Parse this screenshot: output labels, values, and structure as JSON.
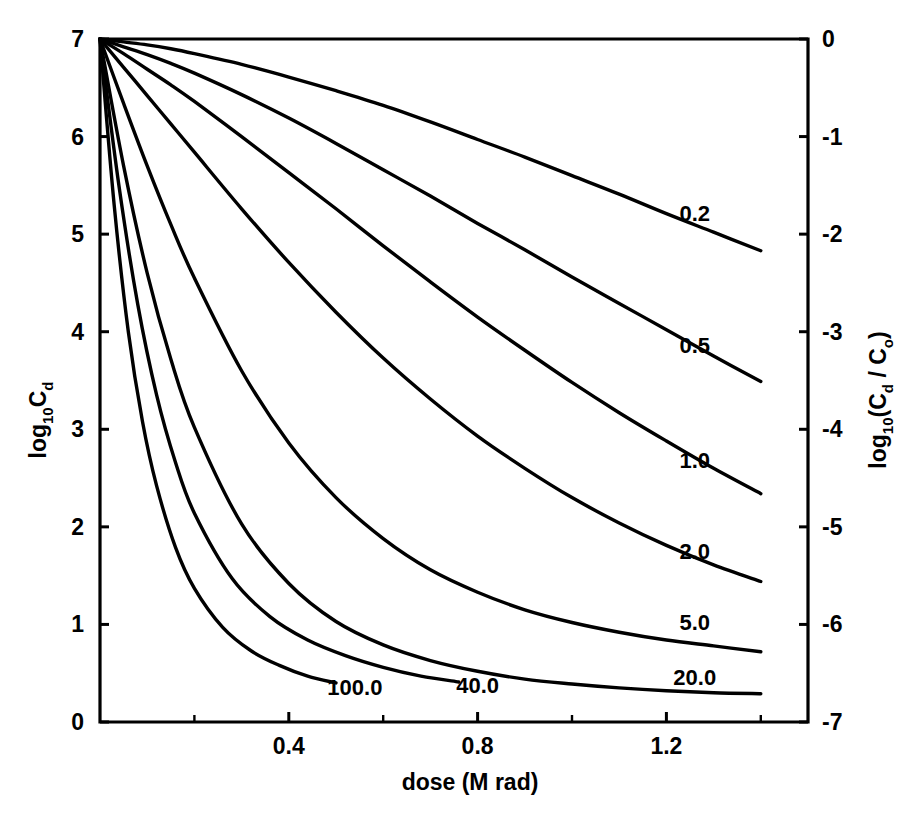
{
  "chart_data": {
    "type": "line",
    "title": "",
    "xlabel": "dose (M rad)",
    "ylabel": "log",
    "ylabel_sub": "10",
    "ylabel_tail": "C",
    "ylabel_tail_sub": "d",
    "ylabel_right_prefix": "log",
    "ylabel_right_sub": "10",
    "ylabel_right_tail": "(C",
    "ylabel_right_tail_sub": "d",
    "ylabel_right_tail2": " / C",
    "ylabel_right_tail2_sub": "o",
    "ylabel_right_tail3": ")",
    "xlim": [
      0.0,
      1.5
    ],
    "ylim": [
      0,
      7
    ],
    "y2lim": [
      -7,
      0
    ],
    "grid": false,
    "legend_position": "inline-right-of-curve-ends",
    "x_tick_labels": [
      "0.4",
      "0.8",
      "1.2"
    ],
    "x_tick_values": [
      0.4,
      0.8,
      1.2
    ],
    "x_minor_tick_values": [
      0.2,
      0.6,
      1.0,
      1.4
    ],
    "y_tick_labels": [
      "0",
      "1",
      "2",
      "3",
      "4",
      "5",
      "6",
      "7"
    ],
    "y_tick_values": [
      0,
      1,
      2,
      3,
      4,
      5,
      6,
      7
    ],
    "y2_tick_labels": [
      "0",
      "-1",
      "-2",
      "-3",
      "-4",
      "-5",
      "-6",
      "-7"
    ],
    "y2_tick_values": [
      0,
      -1,
      -2,
      -3,
      -4,
      -5,
      -6,
      -7
    ],
    "series": [
      {
        "name": "0.2",
        "label": "0.2",
        "x": [
          0.0,
          0.05,
          0.1,
          0.15,
          0.2,
          0.3,
          0.4,
          0.5,
          0.6,
          0.7,
          0.8,
          0.9,
          1.0,
          1.1,
          1.2,
          1.3,
          1.4
        ],
        "values": [
          7.0,
          6.97,
          6.94,
          6.9,
          6.85,
          6.74,
          6.61,
          6.47,
          6.32,
          6.15,
          5.97,
          5.79,
          5.6,
          5.41,
          5.21,
          5.02,
          4.83
        ]
      },
      {
        "name": "0.5",
        "label": "0.5",
        "x": [
          0.0,
          0.05,
          0.1,
          0.15,
          0.2,
          0.3,
          0.4,
          0.5,
          0.6,
          0.7,
          0.8,
          0.9,
          1.0,
          1.1,
          1.2,
          1.3,
          1.4
        ],
        "values": [
          7.0,
          6.92,
          6.84,
          6.75,
          6.65,
          6.43,
          6.19,
          5.93,
          5.66,
          5.39,
          5.11,
          4.84,
          4.56,
          4.29,
          4.02,
          3.75,
          3.49
        ]
      },
      {
        "name": "1.0",
        "label": "1.0",
        "x": [
          0.0,
          0.05,
          0.1,
          0.15,
          0.2,
          0.3,
          0.4,
          0.5,
          0.6,
          0.7,
          0.8,
          0.9,
          1.0,
          1.1,
          1.2,
          1.3,
          1.4
        ],
        "values": [
          7.0,
          6.85,
          6.69,
          6.53,
          6.36,
          6.0,
          5.63,
          5.26,
          4.88,
          4.51,
          4.15,
          3.81,
          3.48,
          3.17,
          2.88,
          2.6,
          2.34
        ]
      },
      {
        "name": "2.0",
        "label": "2.0",
        "x": [
          0.0,
          0.05,
          0.1,
          0.15,
          0.2,
          0.3,
          0.4,
          0.5,
          0.6,
          0.7,
          0.8,
          0.9,
          1.0,
          1.1,
          1.2,
          1.3,
          1.4
        ],
        "values": [
          7.0,
          6.71,
          6.42,
          6.13,
          5.84,
          5.26,
          4.71,
          4.2,
          3.73,
          3.31,
          2.93,
          2.6,
          2.3,
          2.04,
          1.81,
          1.61,
          1.44
        ]
      },
      {
        "name": "5.0",
        "label": "5.0",
        "x": [
          0.0,
          0.05,
          0.1,
          0.15,
          0.2,
          0.3,
          0.4,
          0.5,
          0.6,
          0.7,
          0.8,
          0.9,
          1.0,
          1.1,
          1.2,
          1.3,
          1.4
        ],
        "values": [
          7.0,
          6.34,
          5.7,
          5.1,
          4.55,
          3.6,
          2.86,
          2.3,
          1.88,
          1.56,
          1.33,
          1.15,
          1.02,
          0.92,
          0.84,
          0.78,
          0.72
        ]
      },
      {
        "name": "20.0",
        "label": "20.0",
        "x": [
          0.0,
          0.05,
          0.1,
          0.15,
          0.2,
          0.3,
          0.4,
          0.5,
          0.6,
          0.7,
          0.8,
          0.9,
          1.0,
          1.1,
          1.2,
          1.3,
          1.4
        ],
        "values": [
          7.0,
          5.7,
          4.6,
          3.72,
          3.02,
          2.03,
          1.42,
          1.03,
          0.79,
          0.63,
          0.52,
          0.44,
          0.39,
          0.35,
          0.32,
          0.3,
          0.29
        ]
      },
      {
        "name": "40.0",
        "label": "40.0",
        "x": [
          0.0,
          0.04,
          0.08,
          0.12,
          0.16,
          0.2,
          0.28,
          0.36,
          0.44,
          0.52,
          0.6,
          0.68,
          0.76
        ],
        "values": [
          7.0,
          5.5,
          4.28,
          3.35,
          2.66,
          2.14,
          1.47,
          1.08,
          0.84,
          0.68,
          0.56,
          0.47,
          0.41
        ]
      },
      {
        "name": "100.0",
        "label": "100.0",
        "x": [
          0.0,
          0.03,
          0.06,
          0.09,
          0.12,
          0.16,
          0.2,
          0.26,
          0.32,
          0.38,
          0.44,
          0.5
        ],
        "values": [
          7.0,
          5.3,
          4.0,
          3.08,
          2.42,
          1.79,
          1.37,
          0.97,
          0.73,
          0.58,
          0.47,
          0.4
        ]
      }
    ],
    "curve_label_positions": [
      {
        "label": "0.2",
        "x": 1.26,
        "y": 5.22
      },
      {
        "label": "0.5",
        "x": 1.26,
        "y": 3.86
      },
      {
        "label": "1.0",
        "x": 1.26,
        "y": 2.69
      },
      {
        "label": "2.0",
        "x": 1.26,
        "y": 1.75
      },
      {
        "label": "5.0",
        "x": 1.26,
        "y": 1.02
      },
      {
        "label": "20.0",
        "x": 1.26,
        "y": 0.46
      },
      {
        "label": "40.0",
        "x": 0.8,
        "y": 0.38
      },
      {
        "label": "100.0",
        "x": 0.54,
        "y": 0.36
      }
    ]
  }
}
